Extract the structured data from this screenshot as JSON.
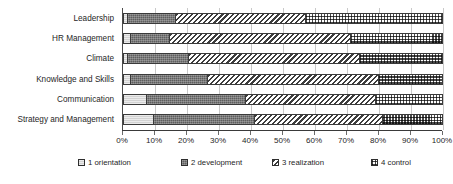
{
  "chart_data": {
    "type": "bar",
    "orientation": "horizontal",
    "stacked": true,
    "normalized": "100%",
    "title": "",
    "subtitle": "",
    "xlabel": "",
    "ylabel": "",
    "xlim": [
      0,
      100
    ],
    "grid": true,
    "legend_position": "bottom",
    "categories": [
      "Leadership",
      "HR Management",
      "Climate",
      "Knowledge and Skills",
      "Communication",
      "Strategy and Management"
    ],
    "xtick_labels": [
      "0%",
      "10%",
      "20%",
      "30%",
      "40%",
      "50%",
      "60%",
      "70%",
      "80%",
      "90%",
      "100%"
    ],
    "xtick_values": [
      0,
      10,
      20,
      30,
      40,
      50,
      60,
      70,
      80,
      90,
      100
    ],
    "series": [
      {
        "name": "1 orientation",
        "pattern": "light-gray-solid",
        "values": [
          1,
          2,
          1,
          2,
          7,
          9
        ]
      },
      {
        "name": "2 development",
        "pattern": "dark-gray-solid",
        "values": [
          15,
          12,
          19,
          24,
          31,
          32
        ]
      },
      {
        "name": "3 realization",
        "pattern": "diagonal-hatch",
        "values": [
          41,
          57,
          54,
          54,
          41,
          40
        ]
      },
      {
        "name": "4 control",
        "pattern": "checkerboard",
        "values": [
          43,
          29,
          26,
          20,
          21,
          19
        ]
      }
    ],
    "cumulative_boundaries": [
      [
        1,
        16,
        57,
        100
      ],
      [
        2,
        14,
        71,
        100
      ],
      [
        1,
        20,
        74,
        100
      ],
      [
        2,
        26,
        80,
        100
      ],
      [
        7,
        38,
        79,
        100
      ],
      [
        9,
        41,
        81,
        100
      ]
    ]
  },
  "legend": {
    "items": [
      {
        "label": "1 orientation"
      },
      {
        "label": "2 development"
      },
      {
        "label": "3 realization"
      },
      {
        "label": "4 control"
      }
    ]
  },
  "colors": {
    "series_1": "#d2d2d2",
    "series_2": "#5e5e5e",
    "series_3": "#3d3d3d",
    "series_4": "#4a4a4a",
    "gridline": "#c9c9c9",
    "axis": "#3a3a3a",
    "text": "#262626",
    "background": "#ffffff"
  }
}
